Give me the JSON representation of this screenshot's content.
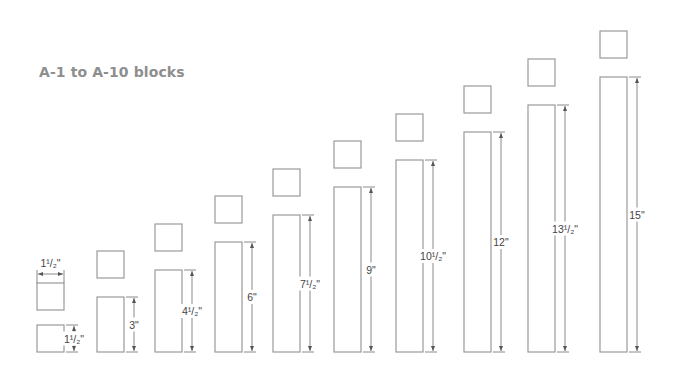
{
  "title": "A-1 to A-10 blocks",
  "colors": {
    "title": "#8e8e8e",
    "outline": "#9a9a9a",
    "dimension": "#6d6d6d",
    "label": "#444444"
  },
  "blocks": [
    {
      "id": "A-1",
      "height_label": "1¹/₂\"",
      "width_label": "1¹/₂\"",
      "height_in": 1.5,
      "width_in": 1.5
    },
    {
      "id": "A-2",
      "height_label": "3\"",
      "height_in": 3.0,
      "width_in": 1.5
    },
    {
      "id": "A-3",
      "height_label": "4¹/₂\"",
      "height_in": 4.5,
      "width_in": 1.5
    },
    {
      "id": "A-4",
      "height_label": "6\"",
      "height_in": 6.0,
      "width_in": 1.5
    },
    {
      "id": "A-5",
      "height_label": "7¹/₂\"",
      "height_in": 7.5,
      "width_in": 1.5
    },
    {
      "id": "A-6",
      "height_label": "9\"",
      "height_in": 9.0,
      "width_in": 1.5
    },
    {
      "id": "A-7",
      "height_label": "10¹/₂\"",
      "height_in": 10.5,
      "width_in": 1.5
    },
    {
      "id": "A-8",
      "height_label": "12\"",
      "height_in": 12.0,
      "width_in": 1.5
    },
    {
      "id": "A-9",
      "height_label": "13¹/₂\"",
      "height_in": 13.5,
      "width_in": 1.5
    },
    {
      "id": "A-10",
      "height_label": "15\"",
      "height_in": 15.0,
      "width_in": 1.5
    }
  ]
}
